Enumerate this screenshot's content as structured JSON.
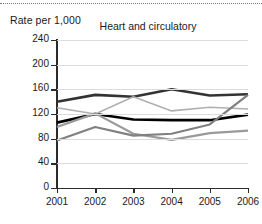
{
  "chart_data": {
    "type": "line",
    "title": "Heart and circulatory",
    "ylabel": "Rate per 1,000",
    "xlabel": "",
    "x": [
      2001,
      2002,
      2003,
      2004,
      2005,
      2006
    ],
    "ylim": [
      0,
      240
    ],
    "yticks": [
      0,
      40,
      80,
      120,
      160,
      200,
      240
    ],
    "xticks": [
      "2001",
      "2002",
      "2003",
      "2004",
      "2005",
      "2006"
    ],
    "grid": true,
    "legend": "none",
    "series": [
      {
        "name": "series-1-dark-thick-upper",
        "color": "#333333",
        "width": 2.6,
        "values": [
          140,
          151,
          148,
          160,
          150,
          152
        ]
      },
      {
        "name": "series-2-black-thick-middle",
        "color": "#000000",
        "width": 2.6,
        "values": [
          106,
          120,
          111,
          110,
          110,
          119
        ]
      },
      {
        "name": "series-3-light-gray",
        "color": "#b0b0b0",
        "width": 1.6,
        "values": [
          130,
          120,
          148,
          125,
          131,
          128
        ]
      },
      {
        "name": "series-4-medium-gray",
        "color": "#9a9a9a",
        "width": 2.2,
        "values": [
          99,
          121,
          88,
          78,
          89,
          93
        ]
      },
      {
        "name": "series-5-gray-rising",
        "color": "#808080",
        "width": 2.2,
        "values": [
          77,
          99,
          85,
          88,
          103,
          151
        ]
      }
    ]
  }
}
